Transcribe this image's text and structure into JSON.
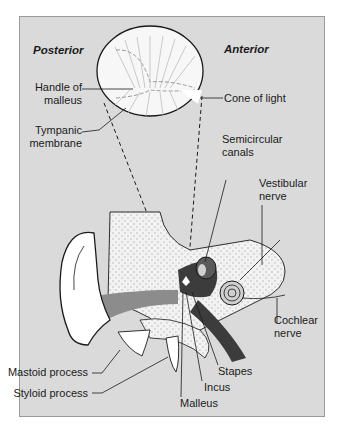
{
  "figure": {
    "orientation": {
      "left": "Posterior",
      "right": "Anterior"
    },
    "inset_labels": {
      "handle_of_malleus": [
        "Handle of",
        "malleus"
      ],
      "cone_of_light": "Cone of light",
      "tympanic_membrane": [
        "Tympanic",
        "membrane"
      ]
    },
    "ear_labels": {
      "semicircular_canals": [
        "Semicircular",
        "canals"
      ],
      "vestibular_nerve": [
        "Vestibular",
        "nerve"
      ],
      "cochlear_nerve": [
        "Cochlear",
        "nerve"
      ],
      "mastoid_process": "Mastoid process",
      "styloid_process": "Styloid process",
      "stapes": "Stapes",
      "incus": "Incus",
      "malleus": "Malleus"
    },
    "colors": {
      "panel": "#dadada",
      "panel_border": "#9a9a9a",
      "bone_fill": "#f4f4f4",
      "canal": "#8a8a8a",
      "dark_structure": "#3a3a3a",
      "outline": "#1a1a1a"
    }
  }
}
